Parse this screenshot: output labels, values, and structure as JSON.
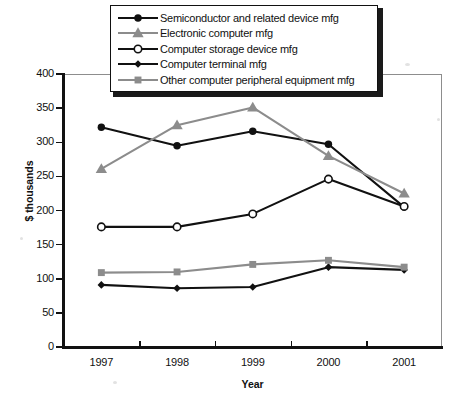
{
  "chart_data": {
    "type": "line",
    "title": "",
    "xlabel": "Year",
    "ylabel": "$ thousands",
    "categories": [
      "1997",
      "1998",
      "1999",
      "2000",
      "2001"
    ],
    "x": [
      1997,
      1998,
      1999,
      2000,
      2001
    ],
    "ylim": [
      0,
      400
    ],
    "yticks": [
      0,
      50,
      100,
      150,
      200,
      250,
      300,
      350,
      400
    ],
    "ytick_labels": [
      "0",
      "50",
      "100",
      "150",
      "200",
      "250",
      "300",
      "350",
      "400"
    ],
    "grid": false,
    "legend_position": "top-center",
    "series": [
      {
        "name": "Semiconductor and related device mfg",
        "values": [
          322,
          295,
          316,
          297,
          205
        ],
        "color": "#111111",
        "marker": "filled-circle",
        "marker_size": 6
      },
      {
        "name": "Electronic computer mfg",
        "values": [
          261,
          325,
          351,
          280,
          225
        ],
        "color": "#8c8c8c",
        "marker": "filled-triangle",
        "marker_size": 6
      },
      {
        "name": "Computer storage device mfg",
        "values": [
          176,
          176,
          195,
          246,
          206
        ],
        "color": "#111111",
        "marker": "open-circle",
        "marker_size": 6
      },
      {
        "name": "Computer terminal mfg",
        "values": [
          91,
          86,
          88,
          117,
          113
        ],
        "color": "#111111",
        "marker": "filled-diamond",
        "marker_size": 4
      },
      {
        "name": "Other computer peripheral equipment mfg",
        "values": [
          109,
          110,
          121,
          127,
          117
        ],
        "color": "#8c8c8c",
        "marker": "filled-square",
        "marker_size": 6
      }
    ]
  },
  "legend": {
    "items": [
      {
        "label": "Semiconductor and related device mfg",
        "marker": "filled-circle-marker",
        "color": "#111111"
      },
      {
        "label": "Electronic computer mfg",
        "marker": "filled-triangle-marker",
        "color": "#8c8c8c"
      },
      {
        "label": "Computer storage device mfg",
        "marker": "open-circle-marker",
        "color": "#111111"
      },
      {
        "label": "Computer terminal mfg",
        "marker": "filled-diamond-marker",
        "color": "#111111"
      },
      {
        "label": "Other computer peripheral equipment mfg",
        "marker": "filled-square-marker",
        "color": "#8c8c8c"
      }
    ]
  }
}
